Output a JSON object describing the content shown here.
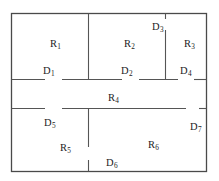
{
  "diagram": {
    "type": "floor-plan",
    "stroke_color": "#555555",
    "text_color": "#1c1c1c",
    "background_color": "#ffffff",
    "rooms": [
      {
        "id": "R1",
        "label": "R",
        "sub": "1",
        "x": 50,
        "y": 39
      },
      {
        "id": "R2",
        "label": "R",
        "sub": "2",
        "x": 124,
        "y": 39
      },
      {
        "id": "R3",
        "label": "R",
        "sub": "3",
        "x": 184,
        "y": 39
      },
      {
        "id": "R4",
        "label": "R",
        "sub": "4",
        "x": 108,
        "y": 93
      },
      {
        "id": "R5",
        "label": "R",
        "sub": "5",
        "x": 60,
        "y": 143
      },
      {
        "id": "R6",
        "label": "R",
        "sub": "6",
        "x": 148,
        "y": 140
      }
    ],
    "doors": [
      {
        "id": "D1",
        "label": "D",
        "sub": "1",
        "x": 43,
        "y": 66
      },
      {
        "id": "D2",
        "label": "D",
        "sub": "2",
        "x": 121,
        "y": 66
      },
      {
        "id": "D3",
        "label": "D",
        "sub": "3",
        "x": 152,
        "y": 22
      },
      {
        "id": "D4",
        "label": "D",
        "sub": "4",
        "x": 180,
        "y": 66
      },
      {
        "id": "D5",
        "label": "D",
        "sub": "5",
        "x": 44,
        "y": 118
      },
      {
        "id": "D6",
        "label": "D",
        "sub": "6",
        "x": 106,
        "y": 158
      },
      {
        "id": "D7",
        "label": "D",
        "sub": "7",
        "x": 190,
        "y": 122
      }
    ]
  }
}
